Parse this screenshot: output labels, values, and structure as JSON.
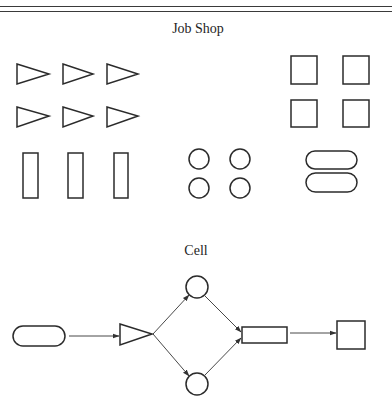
{
  "header": {
    "rules": [
      6,
      11
    ]
  },
  "sections": {
    "job_shop": {
      "title": "Job Shop",
      "title_pos": {
        "x": 198,
        "y": 22
      },
      "triangles": [
        {
          "x1": 17,
          "y1": 64,
          "x2": 17,
          "y2": 84,
          "tx": 49,
          "ty": 74
        },
        {
          "x1": 63,
          "y1": 64,
          "x2": 63,
          "y2": 84,
          "tx": 93,
          "ty": 74
        },
        {
          "x1": 107,
          "y1": 64,
          "x2": 107,
          "y2": 84,
          "tx": 138,
          "ty": 74
        },
        {
          "x1": 17,
          "y1": 107,
          "x2": 17,
          "y2": 127,
          "tx": 49,
          "ty": 116
        },
        {
          "x1": 63,
          "y1": 107,
          "x2": 63,
          "y2": 127,
          "tx": 93,
          "ty": 116
        },
        {
          "x1": 107,
          "y1": 107,
          "x2": 107,
          "y2": 127,
          "tx": 138,
          "ty": 116
        }
      ],
      "rectangles": [
        {
          "x": 23,
          "y": 153,
          "w": 15,
          "h": 45
        },
        {
          "x": 68,
          "y": 153,
          "w": 15,
          "h": 45
        },
        {
          "x": 114,
          "y": 153,
          "w": 14,
          "h": 45
        }
      ],
      "circles": [
        {
          "cx": 199,
          "cy": 159,
          "r": 10
        },
        {
          "cx": 240,
          "cy": 159,
          "r": 10
        },
        {
          "cx": 199,
          "cy": 188,
          "r": 10
        },
        {
          "cx": 240,
          "cy": 188,
          "r": 10
        }
      ],
      "squares": [
        {
          "x": 291,
          "y": 56,
          "w": 26,
          "h": 28
        },
        {
          "x": 343,
          "y": 56,
          "w": 26,
          "h": 28
        },
        {
          "x": 291,
          "y": 100,
          "w": 26,
          "h": 27
        },
        {
          "x": 343,
          "y": 100,
          "w": 26,
          "h": 27
        }
      ],
      "pills": [
        {
          "x": 306,
          "y": 151,
          "w": 51,
          "h": 18
        },
        {
          "x": 306,
          "y": 173,
          "w": 51,
          "h": 19
        }
      ]
    },
    "cell": {
      "title": "Cell",
      "title_pos": {
        "x": 196,
        "y": 244
      },
      "nodes": {
        "pill": {
          "x": 13,
          "y": 326,
          "w": 52,
          "h": 20
        },
        "triangle": {
          "x1": 120,
          "y1": 324,
          "x2": 120,
          "y2": 345,
          "tx": 152,
          "ty": 334
        },
        "circle_top": {
          "cx": 197,
          "cy": 287,
          "r": 11
        },
        "circle_bottom": {
          "cx": 197,
          "cy": 384,
          "r": 11
        },
        "rect": {
          "x": 242,
          "y": 327,
          "w": 45,
          "h": 16
        },
        "square": {
          "x": 337,
          "y": 321,
          "w": 28,
          "h": 28
        }
      },
      "edges": [
        {
          "from": "pill",
          "to": "triangle",
          "x1": 69,
          "y1": 336,
          "x2": 119,
          "y2": 336
        },
        {
          "from": "triangle",
          "to": "circle_top",
          "x1": 153,
          "y1": 334,
          "x2": 189,
          "y2": 295
        },
        {
          "from": "triangle",
          "to": "circle_bottom",
          "x1": 153,
          "y1": 334,
          "x2": 189,
          "y2": 376
        },
        {
          "from": "circle_top",
          "to": "rect",
          "x1": 205,
          "y1": 296,
          "x2": 241,
          "y2": 332
        },
        {
          "from": "circle_bottom",
          "to": "rect",
          "x1": 205,
          "y1": 375,
          "x2": 241,
          "y2": 338
        },
        {
          "from": "rect",
          "to": "square",
          "x1": 290,
          "y1": 333,
          "x2": 336,
          "y2": 333
        }
      ]
    }
  }
}
